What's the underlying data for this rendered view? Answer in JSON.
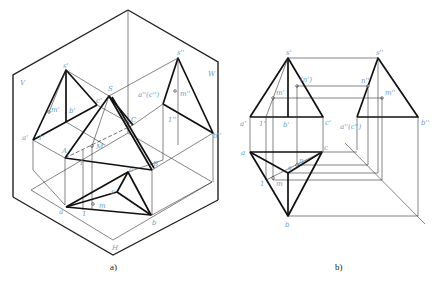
{
  "figure": {
    "panel_a": {
      "caption": "a)",
      "plane_labels": {
        "V": "V",
        "W": "W",
        "H": "H"
      },
      "points": {
        "s_prime": "s'",
        "s_dprime": "s''",
        "S": "S",
        "a_prime": "a'",
        "b_prime": "b'",
        "c_prime": "c'",
        "m_prime": "m'",
        "one_prime": "1'",
        "a_dprime_c_dprime": "a''(c'')",
        "b_dprime": "b''",
        "m_dprime": "m''",
        "one_dprime": "1''",
        "A": "A",
        "B": "B",
        "C": "C",
        "M": "M",
        "I": "I",
        "a": "a",
        "b": "b",
        "c": "c",
        "s": "s",
        "m": "m",
        "one": "1"
      }
    },
    "panel_b": {
      "caption": "b)",
      "points": {
        "s_prime": "s'",
        "s_dprime": "s''",
        "n_prime": "(n')",
        "n_dprime": "n''",
        "m_prime": "m'",
        "m_dprime": "m''",
        "a_prime": "a'",
        "one_prime": "1'",
        "b_prime": "b'",
        "c_prime": "c'",
        "a_dprime_c_dprime": "a''(c'')",
        "b_dprime": "b''",
        "a": "a",
        "c": "c",
        "s": "s",
        "n": "n",
        "one": "1",
        "m": "m",
        "b": "b"
      }
    },
    "colors": {
      "line": "#111111",
      "label": "#6aa0c8",
      "background": "#ffffff"
    }
  }
}
